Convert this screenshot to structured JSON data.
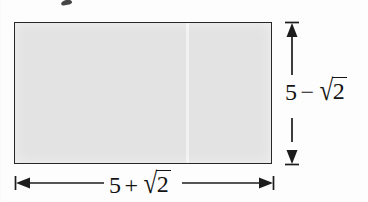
{
  "figure": {
    "name": "rectangle-dimension-diagram",
    "shape": {
      "type": "rectangle",
      "fill_color": "#e3e3e3",
      "stroke_color": "#272727"
    },
    "background_color": "#fdfdfd",
    "ink_color": "#1c1c1c"
  },
  "width_dimension": {
    "name": "width",
    "label_parts": {
      "first_term": "5",
      "operator": "+",
      "radical_symbol": "√",
      "radicand": "2"
    },
    "label_text": "5 + √2",
    "position": "below",
    "arrow_style": "double-headed-with-end-ticks"
  },
  "height_dimension": {
    "name": "height",
    "label_parts": {
      "first_term": "5",
      "operator": "−",
      "radical_symbol": "√",
      "radicand": "2"
    },
    "label_text": "5 − √2",
    "position": "right",
    "arrow_style": "double-headed-with-end-ticks"
  },
  "artifacts": {
    "top_ink_mark": "",
    "page_fold_line": ""
  }
}
